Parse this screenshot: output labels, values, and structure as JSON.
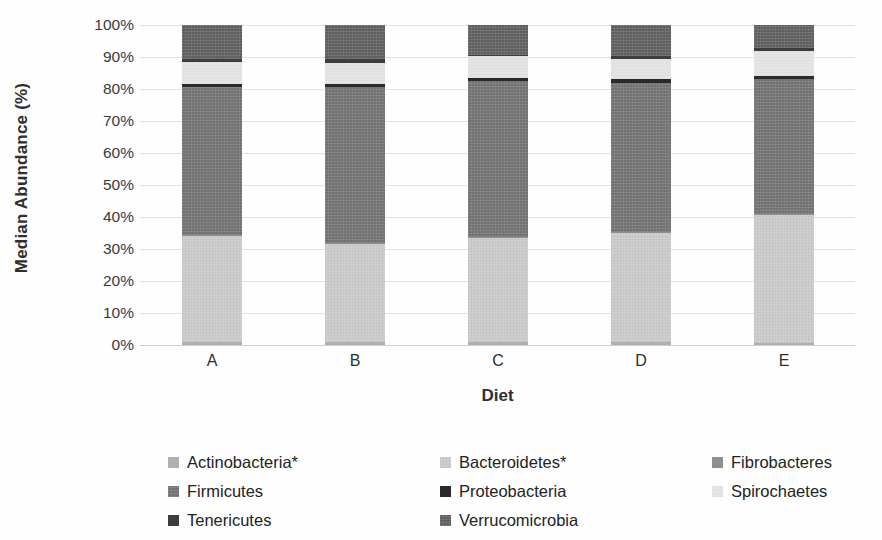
{
  "chart_data": {
    "type": "bar",
    "subtype": "stacked-100-percent",
    "title": "",
    "xlabel": "Diet",
    "ylabel": "Median Abundance (%)",
    "ylim": [
      0,
      100
    ],
    "ytick_labels": [
      "100%",
      "90%",
      "80%",
      "70%",
      "60%",
      "50%",
      "40%",
      "30%",
      "20%",
      "10%",
      "0%"
    ],
    "ytick_values": [
      100,
      90,
      80,
      70,
      60,
      50,
      40,
      30,
      20,
      10,
      0
    ],
    "grid": true,
    "grid_axis": "y",
    "legend_position": "bottom",
    "legend_columns": 3,
    "categories": [
      "A",
      "B",
      "C",
      "D",
      "E"
    ],
    "series": [
      {
        "name": "Actinobacteria*",
        "color": "#b0b0b0",
        "values": [
          0.8,
          0.9,
          1.0,
          0.8,
          0.7
        ]
      },
      {
        "name": "Bacteroidetes*",
        "color": "#cfcfcf",
        "values": [
          33.4,
          30.8,
          32.6,
          34.3,
          39.8
        ]
      },
      {
        "name": "Fibrobacteres",
        "color": "#8f8f8f",
        "values": [
          0.3,
          0.3,
          0.3,
          0.3,
          0.3
        ]
      },
      {
        "name": "Firmicutes",
        "color": "#7c7c7c",
        "values": [
          46.0,
          48.5,
          48.6,
          46.6,
          42.2
        ]
      },
      {
        "name": "Proteobacteria",
        "color": "#2a2a2a",
        "values": [
          1.0,
          1.0,
          0.9,
          1.0,
          1.0
        ]
      },
      {
        "name": "Spirochaetes",
        "color": "#e4e4e4",
        "values": [
          6.9,
          6.8,
          6.9,
          6.3,
          7.9
        ]
      },
      {
        "name": "Tenericutes",
        "color": "#3d3d3d",
        "values": [
          1.1,
          1.0,
          0.2,
          0.9,
          1.0
        ]
      },
      {
        "name": "Verrucomicrobia",
        "color": "#696969",
        "values": [
          10.5,
          10.7,
          9.5,
          9.8,
          7.1
        ]
      }
    ]
  },
  "axis": {
    "y_title": "Median Abundance (%)",
    "x_title": "Diet"
  },
  "legend": {
    "entries": [
      {
        "label": "Actinobacteria*",
        "swatch": "#b0b0b0",
        "fill_class": "f-actinobacteria"
      },
      {
        "label": "Bacteroidetes*",
        "swatch": "#cfcfcf",
        "fill_class": "f-bacteroidetes"
      },
      {
        "label": "Fibrobacteres",
        "swatch": "#8f8f8f",
        "fill_class": "f-fibrobacteres"
      },
      {
        "label": "Firmicutes",
        "swatch": "#7c7c7c",
        "fill_class": "f-firmicutes"
      },
      {
        "label": "Proteobacteria",
        "swatch": "#2a2a2a",
        "fill_class": "f-proteobacteria"
      },
      {
        "label": "Spirochaetes",
        "swatch": "#e4e4e4",
        "fill_class": "f-spirochaetes"
      },
      {
        "label": "Tenericutes",
        "swatch": "#3d3d3d",
        "fill_class": "f-tenericutes"
      },
      {
        "label": "Verrucomicrobia",
        "swatch": "#696969",
        "fill_class": "f-verrucomicrobia"
      }
    ]
  },
  "style": {
    "background": "#fefefe",
    "gridline_color": "#e2e2e2",
    "text_color": "#2b2b2b"
  }
}
